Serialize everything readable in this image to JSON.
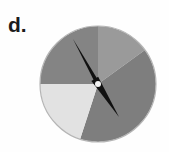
{
  "figure": {
    "panel_label": "d.",
    "background_color": "#fefefe",
    "label_color": "#1c1c1c"
  },
  "chart_data": {
    "type": "pie",
    "title": "d.",
    "xlabel": "",
    "ylabel": "",
    "legend": "none",
    "grid": false,
    "start_angle_deg": 0,
    "direction": "clockwise",
    "center_px": [
      98,
      84
    ],
    "radius_px": 58,
    "categories": [
      "slice-1",
      "slice-2",
      "slice-3",
      "slice-4"
    ],
    "values": [
      15,
      40,
      20,
      25
    ],
    "labels": [
      "",
      "",
      "",
      ""
    ],
    "colors": [
      "#9a9a9a",
      "#7e7e7e",
      "#e2e2e2",
      "#848484"
    ],
    "slices": [
      {
        "name": "slice-1",
        "color": "#9a9a9a",
        "start_deg": 0,
        "end_deg": 54,
        "percent": 15
      },
      {
        "name": "slice-2",
        "color": "#7e7e7e",
        "start_deg": 54,
        "end_deg": 198,
        "percent": 40
      },
      {
        "name": "slice-3",
        "color": "#e2e2e2",
        "start_deg": 198,
        "end_deg": 270,
        "percent": 20
      },
      {
        "name": "slice-4",
        "color": "#848484",
        "start_deg": 270,
        "end_deg": 360,
        "percent": 25
      }
    ]
  },
  "clock": {
    "outline_color": "#b5b5b5",
    "hand_color": "#111111",
    "hub_color": "#f2f2f2",
    "minute_hand": {
      "name": "minute-hand",
      "tip_px": [
        73,
        39
      ],
      "angle_deg": 331,
      "length_px": 51
    },
    "hour_hand": {
      "name": "hour-hand",
      "tip_px": [
        119,
        117
      ],
      "angle_deg": 133,
      "length_px": 40
    },
    "hub_radius_px": 3
  }
}
